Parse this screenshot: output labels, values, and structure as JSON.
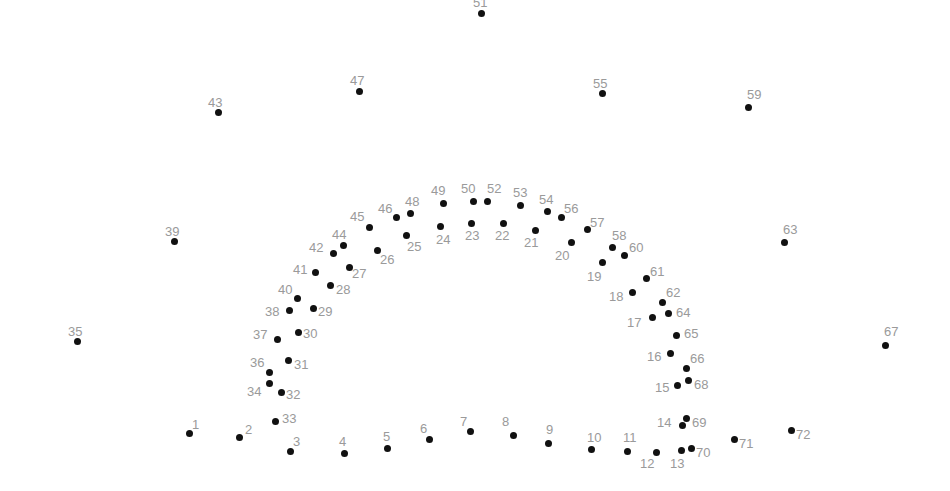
{
  "puzzle": {
    "type": "connect-the-dots",
    "dot_color": "#111111",
    "label_color": "#9a9a9a",
    "background": "#ffffff",
    "points": [
      {
        "n": "1",
        "x": 189,
        "y": 433,
        "lx": 192,
        "ly": 418
      },
      {
        "n": "2",
        "x": 239,
        "y": 437,
        "lx": 245,
        "ly": 423
      },
      {
        "n": "3",
        "x": 290,
        "y": 451,
        "lx": 293,
        "ly": 435
      },
      {
        "n": "4",
        "x": 344,
        "y": 453,
        "lx": 339,
        "ly": 435
      },
      {
        "n": "5",
        "x": 387,
        "y": 448,
        "lx": 383,
        "ly": 430
      },
      {
        "n": "6",
        "x": 429,
        "y": 439,
        "lx": 420,
        "ly": 422
      },
      {
        "n": "7",
        "x": 470,
        "y": 431,
        "lx": 460,
        "ly": 415
      },
      {
        "n": "8",
        "x": 513,
        "y": 435,
        "lx": 502,
        "ly": 415
      },
      {
        "n": "9",
        "x": 548,
        "y": 443,
        "lx": 546,
        "ly": 423
      },
      {
        "n": "10",
        "x": 591,
        "y": 449,
        "lx": 587,
        "ly": 431
      },
      {
        "n": "11",
        "x": 627,
        "y": 451,
        "lx": 623,
        "ly": 431
      },
      {
        "n": "12",
        "x": 656,
        "y": 452,
        "lx": 640,
        "ly": 457
      },
      {
        "n": "13",
        "x": 681,
        "y": 450,
        "lx": 670,
        "ly": 457
      },
      {
        "n": "14",
        "x": 682,
        "y": 425,
        "lx": 657,
        "ly": 416
      },
      {
        "n": "15",
        "x": 677,
        "y": 385,
        "lx": 655,
        "ly": 381
      },
      {
        "n": "16",
        "x": 670,
        "y": 353,
        "lx": 647,
        "ly": 350
      },
      {
        "n": "17",
        "x": 652,
        "y": 317,
        "lx": 627,
        "ly": 316
      },
      {
        "n": "18",
        "x": 632,
        "y": 292,
        "lx": 609,
        "ly": 290
      },
      {
        "n": "19",
        "x": 602,
        "y": 262,
        "lx": 587,
        "ly": 270
      },
      {
        "n": "20",
        "x": 571,
        "y": 242,
        "lx": 555,
        "ly": 249
      },
      {
        "n": "21",
        "x": 535,
        "y": 230,
        "lx": 524,
        "ly": 236
      },
      {
        "n": "22",
        "x": 503,
        "y": 223,
        "lx": 495,
        "ly": 229
      },
      {
        "n": "23",
        "x": 471,
        "y": 223,
        "lx": 465,
        "ly": 229
      },
      {
        "n": "24",
        "x": 440,
        "y": 226,
        "lx": 436,
        "ly": 233
      },
      {
        "n": "25",
        "x": 406,
        "y": 235,
        "lx": 407,
        "ly": 240
      },
      {
        "n": "26",
        "x": 377,
        "y": 250,
        "lx": 380,
        "ly": 253
      },
      {
        "n": "27",
        "x": 349,
        "y": 267,
        "lx": 352,
        "ly": 267
      },
      {
        "n": "28",
        "x": 330,
        "y": 285,
        "lx": 336,
        "ly": 283
      },
      {
        "n": "29",
        "x": 313,
        "y": 308,
        "lx": 318,
        "ly": 305
      },
      {
        "n": "30",
        "x": 298,
        "y": 332,
        "lx": 303,
        "ly": 327
      },
      {
        "n": "31",
        "x": 288,
        "y": 360,
        "lx": 294,
        "ly": 358
      },
      {
        "n": "32",
        "x": 281,
        "y": 392,
        "lx": 286,
        "ly": 388
      },
      {
        "n": "33",
        "x": 275,
        "y": 421,
        "lx": 282,
        "ly": 412
      },
      {
        "n": "34",
        "x": 269,
        "y": 383,
        "lx": 247,
        "ly": 385
      },
      {
        "n": "35",
        "x": 77,
        "y": 341,
        "lx": 68,
        "ly": 325
      },
      {
        "n": "36",
        "x": 269,
        "y": 372,
        "lx": 250,
        "ly": 356
      },
      {
        "n": "37",
        "x": 277,
        "y": 339,
        "lx": 253,
        "ly": 328
      },
      {
        "n": "38",
        "x": 289,
        "y": 310,
        "lx": 265,
        "ly": 305
      },
      {
        "n": "39",
        "x": 174,
        "y": 241,
        "lx": 165,
        "ly": 225
      },
      {
        "n": "40",
        "x": 297,
        "y": 298,
        "lx": 278,
        "ly": 283
      },
      {
        "n": "41",
        "x": 315,
        "y": 272,
        "lx": 293,
        "ly": 263
      },
      {
        "n": "42",
        "x": 333,
        "y": 253,
        "lx": 309,
        "ly": 241
      },
      {
        "n": "43",
        "x": 218,
        "y": 112,
        "lx": 208,
        "ly": 96
      },
      {
        "n": "44",
        "x": 343,
        "y": 245,
        "lx": 332,
        "ly": 228
      },
      {
        "n": "45",
        "x": 369,
        "y": 227,
        "lx": 350,
        "ly": 210
      },
      {
        "n": "46",
        "x": 396,
        "y": 217,
        "lx": 378,
        "ly": 202
      },
      {
        "n": "47",
        "x": 359,
        "y": 91,
        "lx": 350,
        "ly": 74
      },
      {
        "n": "48",
        "x": 410,
        "y": 213,
        "lx": 405,
        "ly": 195
      },
      {
        "n": "49",
        "x": 443,
        "y": 203,
        "lx": 431,
        "ly": 184
      },
      {
        "n": "50",
        "x": 473,
        "y": 201,
        "lx": 461,
        "ly": 182
      },
      {
        "n": "51",
        "x": 481,
        "y": 13,
        "lx": 473,
        "ly": -4
      },
      {
        "n": "52",
        "x": 487,
        "y": 201,
        "lx": 487,
        "ly": 182
      },
      {
        "n": "53",
        "x": 520,
        "y": 205,
        "lx": 513,
        "ly": 186
      },
      {
        "n": "54",
        "x": 547,
        "y": 211,
        "lx": 539,
        "ly": 193
      },
      {
        "n": "55",
        "x": 602,
        "y": 93,
        "lx": 593,
        "ly": 77
      },
      {
        "n": "56",
        "x": 561,
        "y": 217,
        "lx": 564,
        "ly": 202
      },
      {
        "n": "57",
        "x": 587,
        "y": 229,
        "lx": 590,
        "ly": 216
      },
      {
        "n": "58",
        "x": 612,
        "y": 247,
        "lx": 612,
        "ly": 229
      },
      {
        "n": "59",
        "x": 748,
        "y": 107,
        "lx": 747,
        "ly": 88
      },
      {
        "n": "60",
        "x": 624,
        "y": 255,
        "lx": 629,
        "ly": 241
      },
      {
        "n": "61",
        "x": 646,
        "y": 278,
        "lx": 650,
        "ly": 265
      },
      {
        "n": "62",
        "x": 662,
        "y": 302,
        "lx": 666,
        "ly": 286
      },
      {
        "n": "63",
        "x": 784,
        "y": 242,
        "lx": 783,
        "ly": 223
      },
      {
        "n": "64",
        "x": 668,
        "y": 313,
        "lx": 676,
        "ly": 306
      },
      {
        "n": "65",
        "x": 676,
        "y": 335,
        "lx": 684,
        "ly": 327
      },
      {
        "n": "66",
        "x": 686,
        "y": 368,
        "lx": 690,
        "ly": 352
      },
      {
        "n": "67",
        "x": 885,
        "y": 345,
        "lx": 884,
        "ly": 325
      },
      {
        "n": "68",
        "x": 688,
        "y": 380,
        "lx": 694,
        "ly": 378
      },
      {
        "n": "69",
        "x": 686,
        "y": 418,
        "lx": 692,
        "ly": 416
      },
      {
        "n": "70",
        "x": 691,
        "y": 448,
        "lx": 696,
        "ly": 446
      },
      {
        "n": "71",
        "x": 734,
        "y": 439,
        "lx": 739,
        "ly": 437
      },
      {
        "n": "72",
        "x": 791,
        "y": 430,
        "lx": 796,
        "ly": 428
      }
    ]
  }
}
